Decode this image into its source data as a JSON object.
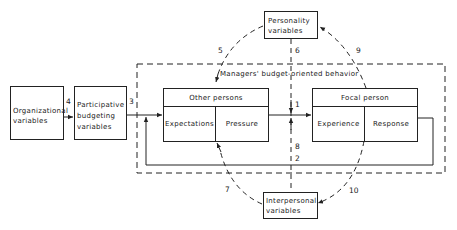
{
  "diagram": {
    "nodes": {
      "personality": {
        "line1": "Personality",
        "line2": "variables"
      },
      "organizational": {
        "line1": "Organizational",
        "line2": "variables"
      },
      "participative": {
        "line1": "Participative",
        "line2": "budgeting",
        "line3": "variables"
      },
      "interpersonal": {
        "line1": "Interpersonal",
        "line2": "variables"
      },
      "other_persons": {
        "header": "Other persons",
        "left": "Expectations",
        "right": "Pressure"
      },
      "focal_person": {
        "header": "Focal person",
        "left": "Experience",
        "right": "Response"
      }
    },
    "group_label": "Managers' budget-oriented behavior",
    "edge_labels": {
      "e1": "1",
      "e2": "2",
      "e3": "3",
      "e4": "4",
      "e5": "5",
      "e6": "6",
      "e7": "7",
      "e8": "8",
      "e9": "9",
      "e10": "10"
    }
  }
}
